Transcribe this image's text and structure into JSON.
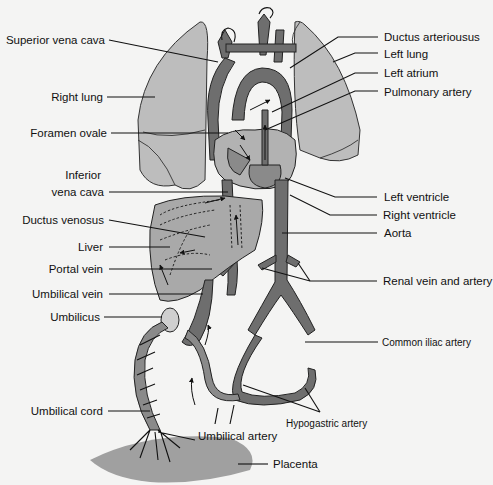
{
  "diagram": {
    "colors": {
      "background": "#f4f4f3",
      "lung": "#bdbdbd",
      "vessel_dark": "#6e6e6e",
      "vessel_mid": "#8a8a8a",
      "liver": "#a9a9a9",
      "placenta": "#a0a0a0",
      "text": "#111111"
    },
    "labels_left": [
      {
        "id": "superior-vena-cava",
        "text": "Superior vena cava"
      },
      {
        "id": "right-lung",
        "text": "Right lung"
      },
      {
        "id": "foramen-ovale",
        "text": "Foramen ovale"
      },
      {
        "id": "inferior-vena-cava-1",
        "text": "Inferior"
      },
      {
        "id": "inferior-vena-cava-2",
        "text": "vena cava"
      },
      {
        "id": "ductus-venosus",
        "text": "Ductus venosus"
      },
      {
        "id": "liver",
        "text": "Liver"
      },
      {
        "id": "portal-vein",
        "text": "Portal vein"
      },
      {
        "id": "umbilical-vein",
        "text": "Umbilical vein"
      },
      {
        "id": "umbilicus",
        "text": "Umbilicus"
      },
      {
        "id": "umbilical-cord",
        "text": "Umbilical cord"
      }
    ],
    "labels_right": [
      {
        "id": "ductus-arteriosus",
        "text": "Ductus arteriousus"
      },
      {
        "id": "left-lung",
        "text": "Left lung"
      },
      {
        "id": "left-atrium",
        "text": "Left atrium"
      },
      {
        "id": "pulmonary-artery",
        "text": "Pulmonary artery"
      },
      {
        "id": "left-ventricle",
        "text": "Left ventricle"
      },
      {
        "id": "right-ventricle",
        "text": "Right ventricle"
      },
      {
        "id": "aorta",
        "text": "Aorta"
      },
      {
        "id": "renal-vein-artery",
        "text": "Renal vein and artery"
      },
      {
        "id": "common-iliac-artery",
        "text": "Common iliac artery"
      }
    ],
    "labels_bottom": [
      {
        "id": "hypogastric-artery",
        "text": "Hypogastric artery"
      },
      {
        "id": "umbilical-artery",
        "text": "Umbilical artery"
      },
      {
        "id": "placenta",
        "text": "Placenta"
      }
    ]
  }
}
